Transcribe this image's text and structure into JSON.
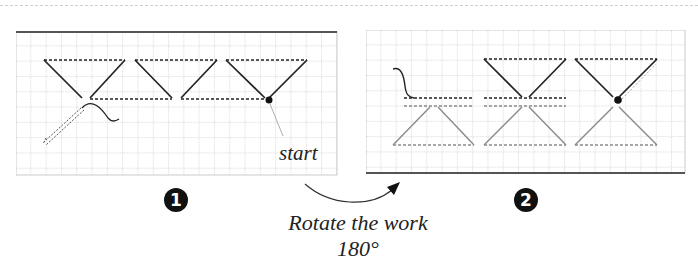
{
  "figure": {
    "panel_1": {
      "step_number": "1",
      "start_label": "start",
      "grid": {
        "cols": 21,
        "rows": 9,
        "cell_px": 15.3
      }
    },
    "panel_2": {
      "step_number": "2",
      "grid": {
        "cols": 21,
        "rows": 9,
        "cell_px": 15.3
      }
    },
    "transition": {
      "caption_line_1": "Rotate the work",
      "caption_line_2": "180°"
    },
    "colors": {
      "stitch_dark": "#222222",
      "stitch_light": "#8a8a8a",
      "grid_line": "#bdbdbd",
      "border": "#555555"
    }
  }
}
